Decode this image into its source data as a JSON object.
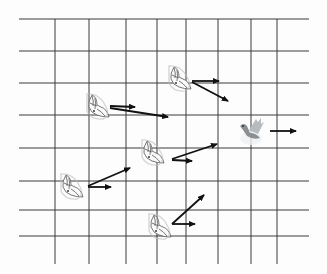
{
  "diagram": {
    "type": "vector-field-grid",
    "grid": {
      "left": 19,
      "right": 309,
      "top": 19,
      "bottom": 264,
      "horizontal_lines_y": [
        19,
        51,
        83,
        115,
        148,
        181,
        210,
        236
      ],
      "vertical_lines_x": [
        55,
        89,
        126,
        157,
        186,
        218,
        251,
        277
      ],
      "line_color": "#3a3a3a"
    },
    "doves": [
      {
        "id": "dove-a",
        "style": "sketch",
        "x": 98,
        "y": 106,
        "arrows": [
          {
            "from": [
              110,
              106
            ],
            "to": [
              135,
              107
            ]
          },
          {
            "from": [
              110,
              108
            ],
            "to": [
              168,
              117
            ]
          }
        ]
      },
      {
        "id": "dove-b",
        "style": "sketch",
        "x": 180,
        "y": 78,
        "arrows": [
          {
            "from": [
              192,
              81
            ],
            "to": [
              219,
              81
            ]
          },
          {
            "from": [
              192,
              82
            ],
            "to": [
              228,
              101
            ]
          }
        ]
      },
      {
        "id": "dove-c",
        "style": "grey-highlight",
        "x": 251,
        "y": 131,
        "arrows": [
          {
            "from": [
              270,
              131
            ],
            "to": [
              296,
              131
            ]
          }
        ]
      },
      {
        "id": "dove-d",
        "style": "sketch",
        "x": 153,
        "y": 152,
        "arrows": [
          {
            "from": [
              172,
              160
            ],
            "to": [
              192,
              161
            ]
          },
          {
            "from": [
              172,
              159
            ],
            "to": [
              217,
              144
            ]
          }
        ]
      },
      {
        "id": "dove-e",
        "style": "sketch",
        "x": 72,
        "y": 186,
        "arrows": [
          {
            "from": [
              88,
              186
            ],
            "to": [
              130,
              168
            ]
          },
          {
            "from": [
              88,
              187
            ],
            "to": [
              111,
              187
            ]
          }
        ]
      },
      {
        "id": "dove-f",
        "style": "sketch",
        "x": 160,
        "y": 226,
        "arrows": [
          {
            "from": [
              172,
              224
            ],
            "to": [
              204,
              195
            ]
          },
          {
            "from": [
              172,
              224
            ],
            "to": [
              195,
              224
            ]
          }
        ]
      }
    ],
    "arrow_color": "#111111"
  }
}
